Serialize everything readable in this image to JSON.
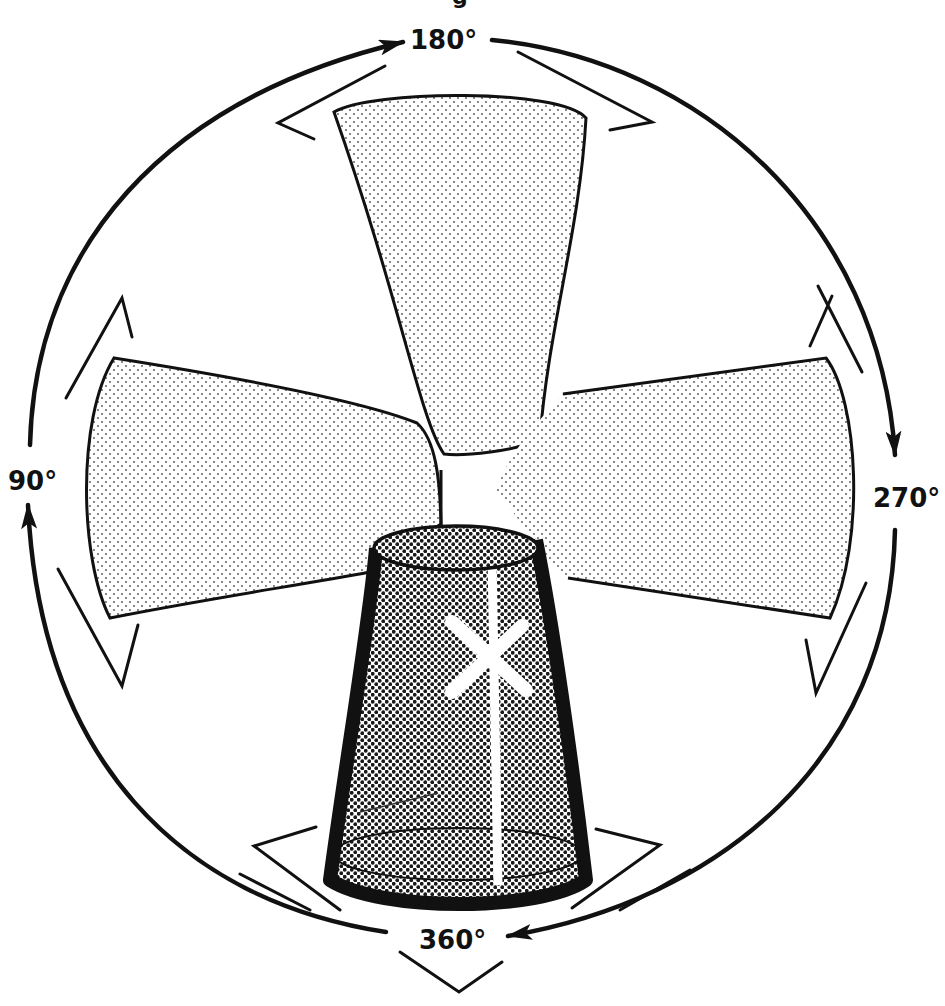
{
  "diagram": {
    "title_fragment": "g",
    "labels": {
      "top": "180°",
      "left": "90°",
      "right": "270°",
      "bottom": "360°"
    },
    "lobes": [
      {
        "position": "top",
        "angle": "180°",
        "shade": "light"
      },
      {
        "position": "left",
        "angle": "90°",
        "shade": "light"
      },
      {
        "position": "right",
        "angle": "270°",
        "shade": "light"
      },
      {
        "position": "bottom",
        "angle": "360°",
        "shade": "dark"
      }
    ],
    "rotation_arrows": [
      {
        "from": "90°",
        "to": "180°",
        "direction": "clockwise"
      },
      {
        "from": "180°",
        "to": "270°",
        "direction": "clockwise"
      },
      {
        "from": "270°",
        "to": "360°",
        "direction": "clockwise"
      },
      {
        "from": "360°",
        "to": "90°",
        "direction": "clockwise"
      }
    ],
    "colors": {
      "ink": "#111111",
      "background": "#ffffff",
      "light_dot": "#6a6a6a",
      "dark_dot": "#1a1a1a"
    }
  }
}
